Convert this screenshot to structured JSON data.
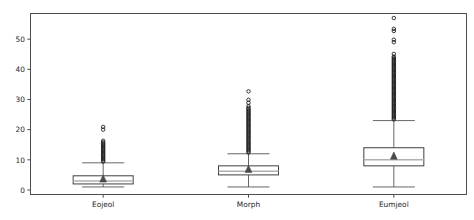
{
  "chart_data": {
    "type": "box",
    "title": "",
    "xlabel": "",
    "ylabel": "",
    "categories": [
      "Eojeol",
      "Morph",
      "Eumjeol"
    ],
    "ylim": [
      -1.5,
      58.5
    ],
    "yticks": [
      0,
      10,
      20,
      30,
      40,
      50
    ],
    "ytick_labels": [
      "0",
      "10",
      "20",
      "30",
      "40",
      "50"
    ],
    "grid": false,
    "legend": "none",
    "box_facecolor": "#ffffff",
    "box_edgecolor": "#3f3f3f",
    "median_color": "#b0b0b0",
    "mean_marker": "triangle",
    "mean_color": "#4a4a4a",
    "outlier_marker": "circle-open",
    "outlier_color": "#1a1a1a",
    "spine_color": "#4d4d4d",
    "series": [
      {
        "name": "Eojeol",
        "min_whisker": 1,
        "q1": 2.0,
        "median": 3.0,
        "q3": 4.7,
        "max_whisker": 9,
        "mean": 3.6,
        "outliers": [
          9.4,
          9.8,
          10.2,
          10.6,
          11.0,
          11.4,
          11.8,
          12.2,
          12.6,
          13.0,
          13.4,
          13.8,
          14.2,
          14.6,
          15.0,
          15.4,
          15.8,
          16.3,
          20.0,
          20.9
        ]
      },
      {
        "name": "Morph",
        "min_whisker": 1,
        "q1": 5.0,
        "median": 6.2,
        "q3": 8.0,
        "max_whisker": 12,
        "mean": 6.8,
        "outliers": [
          12.4,
          12.8,
          13.2,
          13.6,
          14.0,
          14.4,
          14.8,
          15.2,
          15.6,
          16.0,
          16.4,
          16.8,
          17.2,
          17.6,
          18.0,
          18.4,
          18.8,
          19.2,
          19.6,
          20.0,
          20.4,
          20.8,
          21.2,
          21.6,
          22.0,
          22.4,
          22.8,
          23.2,
          23.6,
          24.0,
          24.4,
          24.8,
          25.2,
          25.6,
          26.0,
          26.4,
          26.8,
          27.2,
          27.8,
          28.9,
          29.9,
          32.7
        ]
      },
      {
        "name": "Eumjeol",
        "min_whisker": 1,
        "q1": 8.0,
        "median": 10.0,
        "q3": 14.0,
        "max_whisker": 23,
        "mean": 11.2,
        "outliers": [
          23.4,
          23.8,
          24.2,
          24.6,
          25.0,
          25.4,
          25.8,
          26.2,
          26.6,
          27.0,
          27.4,
          27.8,
          28.2,
          28.6,
          29.0,
          29.4,
          29.8,
          30.2,
          30.6,
          31.0,
          31.4,
          31.8,
          32.2,
          32.6,
          33.0,
          33.4,
          33.8,
          34.2,
          34.6,
          35.0,
          35.4,
          35.8,
          36.2,
          36.6,
          37.0,
          37.4,
          37.8,
          38.2,
          38.6,
          39.0,
          39.4,
          39.8,
          40.2,
          40.6,
          41.0,
          41.4,
          41.8,
          42.2,
          42.6,
          43.0,
          43.4,
          43.8,
          44.2,
          45.1,
          49.0,
          49.8,
          52.7,
          53.4,
          57.0
        ]
      }
    ]
  }
}
